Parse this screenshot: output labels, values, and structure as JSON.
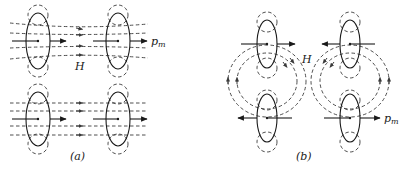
{
  "figure": {
    "panels": [
      {
        "id": "a",
        "caption": "(a)",
        "field_label": "H",
        "moment_label": "p_m",
        "moment_label_main": "p",
        "moment_label_sub": "m",
        "description": "Two pairs of current loops with parallel magnetic moments along the field lines"
      },
      {
        "id": "b",
        "caption": "(b)",
        "field_label": "H",
        "moment_label": "p_m",
        "moment_label_main": "p",
        "moment_label_sub": "m",
        "description": "Current loops with moments arranged in closed circulating field loops"
      }
    ],
    "colors": {
      "line": "#1a1a1a",
      "dashed": "#3a3a3a",
      "background": "#ffffff"
    }
  }
}
